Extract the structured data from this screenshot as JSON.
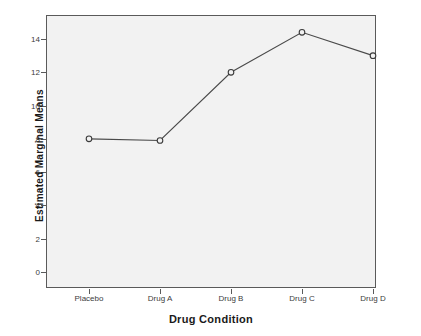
{
  "chart_data": {
    "type": "line",
    "title": "",
    "xlabel": "Drug Condition",
    "ylabel": "Estimated Marginal Means",
    "categories": [
      "Placebo",
      "Drug A",
      "Drug B",
      "Drug C",
      "Drug D"
    ],
    "values": [
      8.0,
      7.9,
      12.0,
      14.4,
      13.0
    ],
    "series": [
      {
        "name": "Estimated Marginal Means",
        "values": [
          8.0,
          7.9,
          12.0,
          14.4,
          13.0
        ]
      }
    ],
    "ylim": [
      0,
      15.4
    ],
    "yticks": [
      0,
      2,
      4,
      6,
      8,
      10,
      12,
      14
    ],
    "ytick_labels": [
      "0",
      "2",
      "4",
      "6",
      "8",
      "10",
      "12",
      "14"
    ],
    "xticks": [
      "Placebo",
      "Drug A",
      "Drug B",
      "Drug C",
      "Drug D"
    ],
    "grid": false,
    "legend": "none",
    "marker": "open-circle",
    "line_color": "#4a4a4a",
    "marker_fill": "#f2f2f2",
    "marker_edge_color": "#3a3a3a",
    "plot_background": "#f2f2f2",
    "frame_color": "#5a5a5a",
    "figure_background": "#ffffff"
  }
}
